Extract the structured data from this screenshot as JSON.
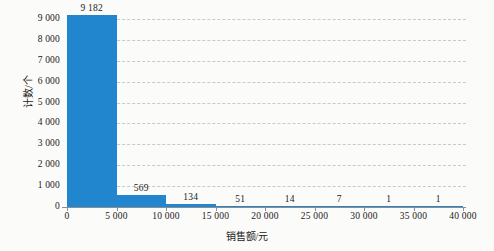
{
  "chart_data": {
    "type": "bar",
    "title": "",
    "subtitle": "",
    "xlabel": "销售额/元",
    "ylabel": "计数/个",
    "bin_width": 5000,
    "categories": [
      "0-5 000",
      "5 000-10 000",
      "10 000-15 000",
      "15 000-20 000",
      "20 000-25 000",
      "25 000-30 000",
      "30 000-35 000",
      "35 000-40 000"
    ],
    "bin_starts": [
      0,
      5000,
      10000,
      15000,
      20000,
      25000,
      30000,
      35000
    ],
    "values": [
      9182,
      569,
      134,
      51,
      14,
      7,
      1,
      1
    ],
    "value_labels": [
      "9 182",
      "569",
      "134",
      "51",
      "14",
      "7",
      "1",
      "1"
    ],
    "xlim": [
      0,
      40000
    ],
    "ylim": [
      0,
      9000
    ],
    "x_ticks": [
      0,
      5000,
      10000,
      15000,
      20000,
      25000,
      30000,
      35000,
      40000
    ],
    "x_tick_labels": [
      "0",
      "5 000",
      "10 000",
      "15 000",
      "20 000",
      "25 000",
      "30 000",
      "35 000",
      "40 000"
    ],
    "y_ticks": [
      0,
      1000,
      2000,
      3000,
      4000,
      5000,
      6000,
      7000,
      8000,
      9000
    ],
    "y_tick_labels": [
      "0",
      "1 000",
      "2 000",
      "3 000",
      "4 000",
      "5 000",
      "6 000",
      "7 000",
      "8 000",
      "9 000"
    ],
    "grid": "horizontal-dashed",
    "legend": "none",
    "colors": {
      "bar": "#2186ce",
      "grid": "#c9c9c9",
      "axis": "#8d8d8d",
      "text": "#1a1a1a",
      "background": "#fbfbf9"
    }
  }
}
